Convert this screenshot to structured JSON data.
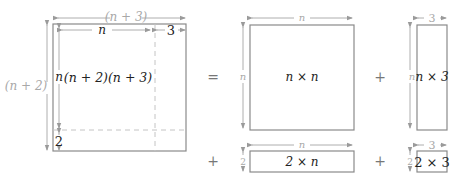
{
  "diagram": {
    "colors": {
      "box_stroke": "#8a8a8a",
      "dimension_line": "#9a9a9a",
      "dashed_divider": "#c4c4c4",
      "label_dark": "#222222",
      "label_gray": "#a8a8a8"
    },
    "main": {
      "width_label": "(n + 3)",
      "height_label": "(n + 2)",
      "inner_width_n": "n",
      "inner_width_3": "3",
      "inner_height_n": "n",
      "inner_height_2": "2",
      "area_label": "(n + 2)(n + 3)"
    },
    "operators": {
      "equals": "=",
      "plus_1": "+",
      "plus_2": "+",
      "plus_3": "+"
    },
    "parts": [
      {
        "id": "nxn",
        "area": "n × n",
        "width": "n",
        "height": "n"
      },
      {
        "id": "nx3",
        "area": "n × 3",
        "width": "3",
        "height": "n"
      },
      {
        "id": "2xn",
        "area": "2 × n",
        "width": "n",
        "height": "2"
      },
      {
        "id": "2x3",
        "area": "2 × 3",
        "width": "3",
        "height": "2"
      }
    ]
  }
}
